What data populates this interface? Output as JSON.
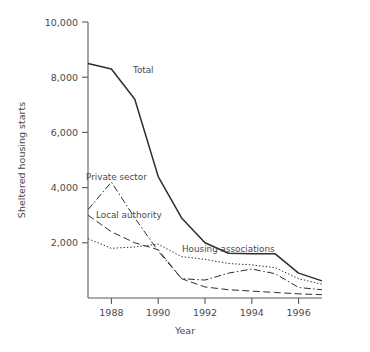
{
  "chart_data": {
    "type": "line",
    "title": "",
    "xlabel": "Year",
    "ylabel": "Sheltered housing starts",
    "x": [
      1987,
      1988,
      1989,
      1990,
      1991,
      1992,
      1993,
      1994,
      1995,
      1996,
      1997
    ],
    "xlim": [
      1987,
      1997
    ],
    "ylim": [
      0,
      10000
    ],
    "xticks": [
      1988,
      1990,
      1992,
      1994,
      1996
    ],
    "xtick_labels": [
      "1988",
      "1990",
      "1992",
      "1994",
      "1996"
    ],
    "yticks": [
      2000,
      4000,
      6000,
      8000,
      10000
    ],
    "ytick_labels": [
      "2,000",
      "4,000",
      "6,000",
      "8,000",
      "10,000"
    ],
    "grid": false,
    "legend_position": "inline-annotations",
    "series": [
      {
        "name": "Total",
        "style": "solid",
        "color": "#2e2e2e",
        "values": [
          8500,
          8300,
          7200,
          4400,
          2900,
          2000,
          1620,
          1600,
          1600,
          900,
          620
        ]
      },
      {
        "name": "Private sector",
        "style": "dash-dot",
        "color": "#2e2e2e",
        "values": [
          3200,
          4200,
          2900,
          1700,
          700,
          650,
          900,
          1050,
          880,
          380,
          300
        ]
      },
      {
        "name": "Local authority",
        "style": "long-dash",
        "color": "#2e2e2e",
        "values": [
          3000,
          2400,
          2000,
          1750,
          700,
          400,
          300,
          250,
          200,
          150,
          120
        ]
      },
      {
        "name": "Housing associations",
        "style": "dotted",
        "color": "#2e2e2e",
        "values": [
          2150,
          1800,
          1850,
          1950,
          1500,
          1400,
          1250,
          1200,
          1100,
          700,
          500
        ]
      }
    ],
    "annotations": [
      {
        "text": "Total",
        "x": 133,
        "y": 73
      },
      {
        "text": "Private sector",
        "x": 86,
        "y": 180
      },
      {
        "text": "Local authority",
        "x": 96,
        "y": 218
      },
      {
        "text": "Housing associations",
        "x": 182,
        "y": 252
      }
    ]
  }
}
